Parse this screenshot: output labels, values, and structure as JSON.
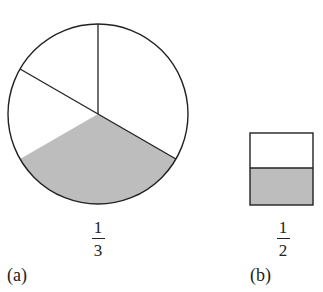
{
  "figure": {
    "panels": [
      {
        "id": "a",
        "label": "(a)",
        "shape": "circle",
        "parts": 3,
        "shaded_parts": 1,
        "shaded_position": "bottom sector",
        "fraction": {
          "numerator": "1",
          "denominator": "3"
        }
      },
      {
        "id": "b",
        "label": "(b)",
        "shape": "square",
        "parts": 2,
        "shaded_parts": 1,
        "shaded_position": "bottom half",
        "fraction": {
          "numerator": "1",
          "denominator": "2"
        }
      }
    ],
    "colors": {
      "stroke": "#222222",
      "shade": "#bdbdbd",
      "background": "#ffffff"
    }
  }
}
